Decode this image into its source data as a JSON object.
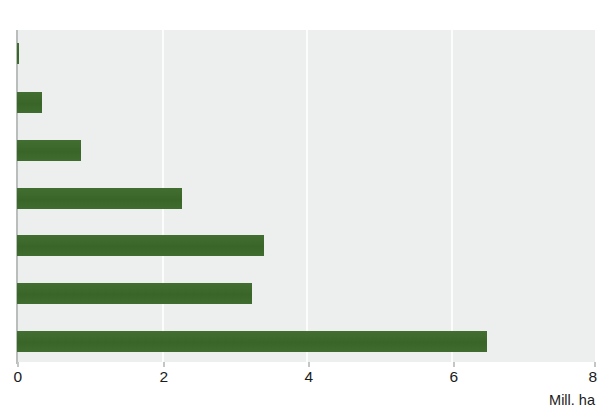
{
  "chart_data": {
    "type": "bar",
    "orientation": "horizontal",
    "title": "",
    "subtitle": "",
    "xlabel": "Mill. ha",
    "ylabel": "",
    "xlim": [
      0,
      8
    ],
    "xticks": [
      0,
      2,
      4,
      6,
      8
    ],
    "xtick_labels": [
      "0",
      "2",
      "4",
      "6",
      "8"
    ],
    "grid": true,
    "grid_axis": "x",
    "legend": false,
    "legend_position": "none",
    "categories": [
      "",
      "",
      "",
      "",
      "",
      "",
      ""
    ],
    "values": [
      0.03,
      0.34,
      0.88,
      2.28,
      3.42,
      3.25,
      6.5
    ],
    "series": [
      {
        "name": "",
        "color": "#3d6b2e",
        "values": [
          0.03,
          0.34,
          0.88,
          2.28,
          3.42,
          3.25,
          6.5
        ]
      }
    ],
    "bars": [
      {
        "index": 0,
        "value": 0.03
      },
      {
        "index": 1,
        "value": 0.34
      },
      {
        "index": 2,
        "value": 0.88
      },
      {
        "index": 3,
        "value": 2.28
      },
      {
        "index": 4,
        "value": 3.42
      },
      {
        "index": 5,
        "value": 3.25
      },
      {
        "index": 6,
        "value": 6.5
      }
    ]
  },
  "axis": {
    "unit_label": "Mill. ha",
    "ticks": [
      {
        "value": 0,
        "label": "0"
      },
      {
        "value": 2,
        "label": "2"
      },
      {
        "value": 4,
        "label": "4"
      },
      {
        "value": 6,
        "label": "6"
      },
      {
        "value": 8,
        "label": "8"
      }
    ]
  },
  "colors": {
    "bar": "#3d6b2e",
    "plot_background": "#edefee",
    "gridline": "#fbfcfb",
    "axis_line": "#b9bebd",
    "text": "#1b1b1b",
    "page_background": "#ffffff"
  }
}
